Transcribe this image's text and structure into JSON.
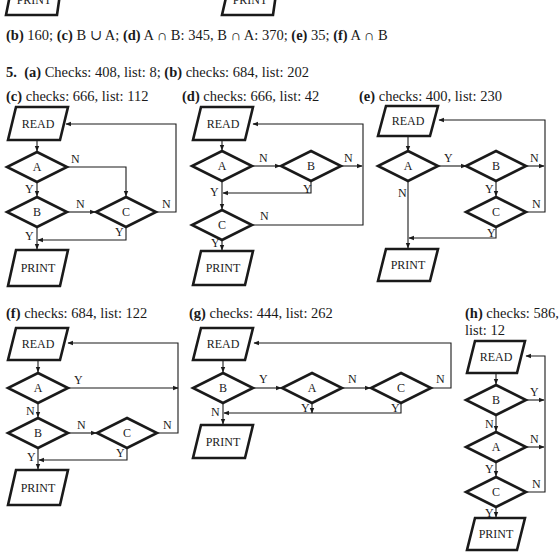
{
  "answers_line": {
    "parts": [
      {
        "tag": "(b)",
        "text": " 160; "
      },
      {
        "tag": "(c)",
        "text": " B ∪ A; "
      },
      {
        "tag": "(d)",
        "text": " A ∩ B: 345, B ∩ A: 370; "
      },
      {
        "tag": "(e)",
        "text": " 35; "
      },
      {
        "tag": "(f)",
        "text": " A ∩ B"
      }
    ]
  },
  "problem5": {
    "number": "5.",
    "intro": [
      {
        "tag": "(a)",
        "text": " Checks: 408, list: 8; "
      },
      {
        "tag": "(b)",
        "text": " checks: 684, list: 202"
      }
    ]
  },
  "top_partial_boxes": [
    "PRINT",
    "PRINT"
  ],
  "flowcharts": [
    {
      "id": "c",
      "tag": "(c)",
      "caption": " checks: 666, list: 112",
      "nodes": {
        "read": "READ",
        "print": "PRINT",
        "d1": "A",
        "d2": "B",
        "d3": "C"
      },
      "edge_labels": {
        "d1_right": "N",
        "d1_down": "Y",
        "d2_right": "N",
        "d2_down": "Y",
        "d3_right": "N",
        "d3_down": "Y"
      }
    },
    {
      "id": "d",
      "tag": "(d)",
      "caption": " checks: 666, list: 42",
      "nodes": {
        "read": "READ",
        "print": "PRINT",
        "d1": "A",
        "d2": "B",
        "d3": "C"
      },
      "edge_labels": {
        "d1_right": "N",
        "d1_down": "Y",
        "d2_right": "N",
        "d2_down": "Y",
        "d3_right": "N",
        "d3_down": "Y"
      }
    },
    {
      "id": "e",
      "tag": "(e)",
      "caption": " checks: 400, list: 230",
      "nodes": {
        "read": "READ",
        "print": "PRINT",
        "d1": "A",
        "d2": "B",
        "d3": "C"
      },
      "edge_labels": {
        "d1_right": "Y",
        "d1_down": "N",
        "d2_right": "N",
        "d2_down": "Y",
        "d3_right": "N",
        "d3_down": "Y"
      }
    },
    {
      "id": "f",
      "tag": "(f)",
      "caption": " checks: 684, list: 122",
      "nodes": {
        "read": "READ",
        "print": "PRINT",
        "d1": "A",
        "d2": "B",
        "d3": "C"
      },
      "edge_labels": {
        "d1_right": "Y",
        "d1_down": "N",
        "d2_right": "N",
        "d2_down": "Y",
        "d3_right": "N",
        "d3_down": "Y"
      }
    },
    {
      "id": "g",
      "tag": "(g)",
      "caption": " checks: 444, list: 262",
      "nodes": {
        "read": "READ",
        "print": "PRINT",
        "d1": "B",
        "d2": "A",
        "d3": "C"
      },
      "edge_labels": {
        "d1_right": "Y",
        "d1_down": "N",
        "d2_right": "N",
        "d2_down": "Y",
        "d3_right": "N",
        "d3_down": "Y"
      }
    },
    {
      "id": "h",
      "tag": "(h)",
      "caption": " checks: 586,",
      "caption2": "list: 12",
      "nodes": {
        "read": "READ",
        "print": "PRINT",
        "d1": "B",
        "d2": "A",
        "d3": "C"
      },
      "edge_labels": {
        "d1_right": "Y",
        "d1_down": "N",
        "d2_right": "N",
        "d2_down": "Y",
        "d3_right": "N",
        "d3_down": "Y"
      }
    }
  ],
  "colors": {
    "ink": "#1a1a1a",
    "background": "#ffffff"
  }
}
